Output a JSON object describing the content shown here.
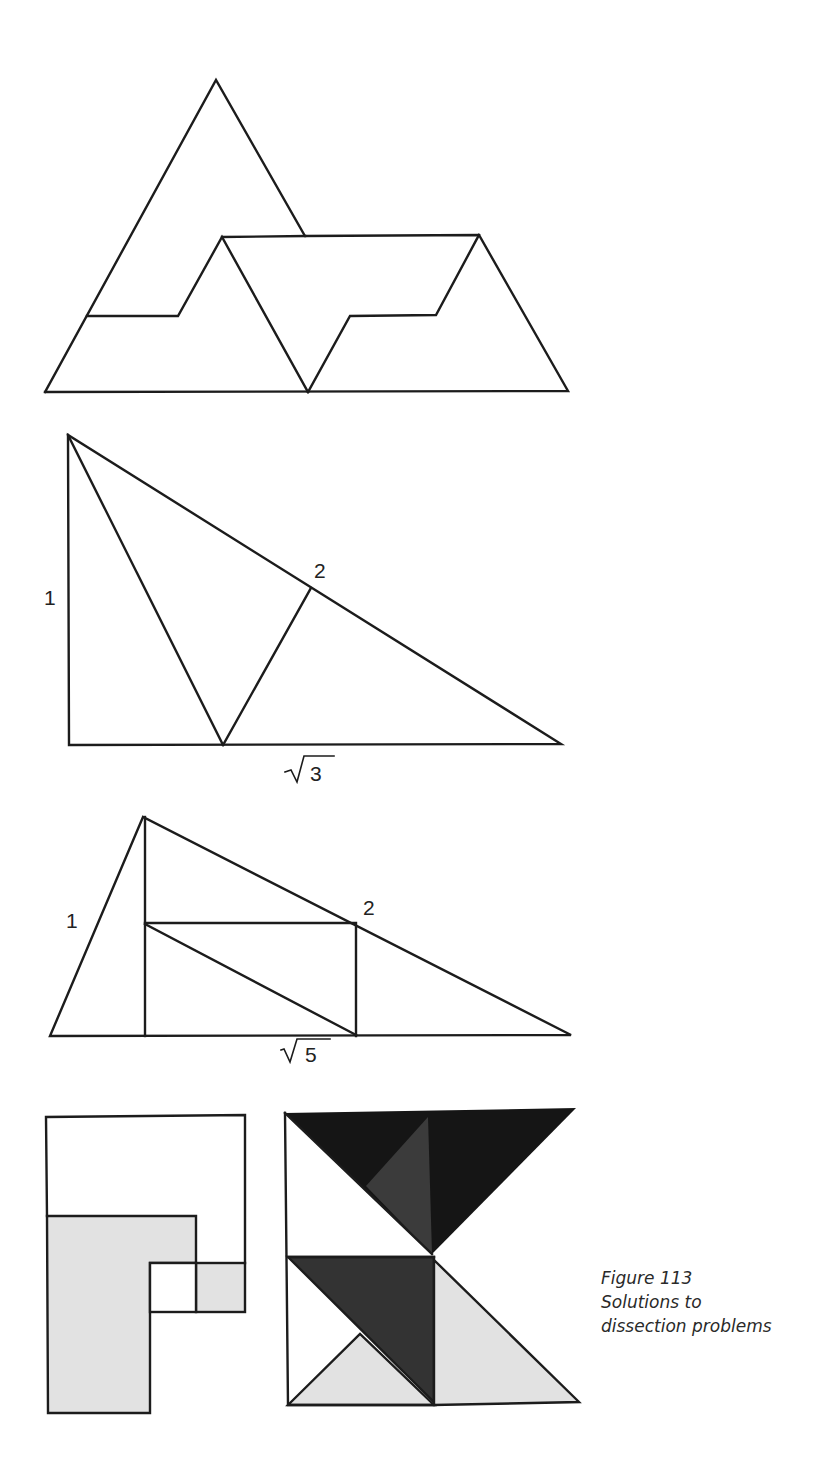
{
  "figure": {
    "number_label": "Figure 113",
    "caption_lines": [
      "Figure 113",
      "Solutions to",
      "dissection problems"
    ]
  },
  "diagrams": [
    {
      "id": "triangle-dissection",
      "description": "Equilateral-style triangle overlapping a trapezoid, dissected with stepped cuts",
      "labels": []
    },
    {
      "id": "right-triangle-sqrt3",
      "labels": {
        "vertical_side": "1",
        "hypotenuse_point": "2",
        "base": "√3",
        "base_radicand": "3"
      }
    },
    {
      "id": "triangle-sqrt5",
      "labels": {
        "left_side": "1",
        "hypotenuse_point": "2",
        "base": "√5",
        "base_radicand": "5"
      }
    },
    {
      "id": "square-L-dissection",
      "labels": []
    },
    {
      "id": "square-triangle-dissection",
      "labels": []
    }
  ],
  "colors": {
    "line": "#1c1c1c",
    "darkest_fill": "#151515",
    "dark_fill": "#3a3a3a",
    "light_fill": "#e2e2e2",
    "background": "#ffffff"
  }
}
